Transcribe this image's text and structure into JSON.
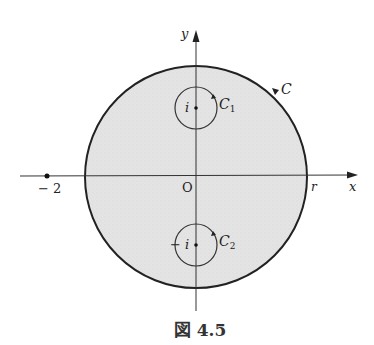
{
  "figure": {
    "caption": "図 4.5",
    "axes": {
      "x_label": "x",
      "y_label": "y",
      "origin_label": "O"
    },
    "point_minus2_label": "− 2",
    "r_label": "r",
    "contour_C": {
      "label": "C"
    },
    "contour_C1": {
      "label": "C",
      "subscript": "1",
      "center_label": "i"
    },
    "contour_C2": {
      "label": "C",
      "subscript": "2",
      "center_label": "− i"
    },
    "colors": {
      "disk_fill": "#e6e6e6",
      "stroke": "#222222"
    }
  }
}
